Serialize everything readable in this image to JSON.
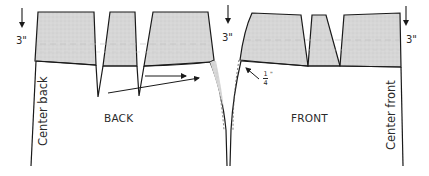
{
  "diagram": {
    "type": "skirt-yoke-pattern",
    "colors": {
      "line": "#1a1a1a",
      "yoke_fill": "#d9d9d9",
      "dash": "#555555",
      "background": "#ffffff"
    },
    "labels": {
      "back": "BACK",
      "front": "FRONT",
      "center_back": "Center back",
      "center_front": "Center front"
    },
    "measurements": {
      "back_yoke_depth": "3\"",
      "side_yoke_depth": "3\"",
      "front_yoke_depth": "3\"",
      "side_seam_adjust_num": "1",
      "side_seam_adjust_den": "4",
      "side_seam_adjust_unit": "\""
    },
    "panels": [
      {
        "name": "back",
        "yoke_sections": 3,
        "darts": 2
      },
      {
        "name": "front",
        "yoke_sections": 3,
        "darts": 2
      }
    ]
  }
}
